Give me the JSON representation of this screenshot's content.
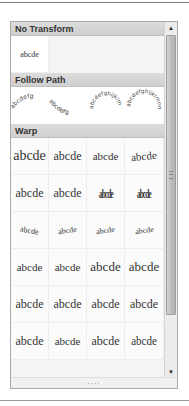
{
  "gallery": {
    "sections": [
      {
        "title": "No Transform"
      },
      {
        "title": "Follow Path"
      },
      {
        "title": "Warp"
      }
    ],
    "no_transform": {
      "sample": "abcde"
    },
    "follow_path": {
      "items": [
        {
          "name": "arch-up",
          "text": "abcdefg"
        },
        {
          "name": "arch-down",
          "text": "abcdefg"
        },
        {
          "name": "circle",
          "text": "abcdefghijklm"
        },
        {
          "name": "button",
          "text": "abcdefghijklmno"
        }
      ]
    },
    "warp": {
      "rows": [
        [
          "abcde",
          "abcde",
          "abcde",
          "abcde"
        ],
        [
          "abcde",
          "abcde",
          "abcde",
          "abcde"
        ],
        [
          "abcde",
          "abcde",
          "abcde",
          "abcde"
        ],
        [
          "abcde",
          "abcde",
          "abcde",
          "abcde"
        ],
        [
          "abcde",
          "abcde",
          "abcde",
          "abcde"
        ],
        [
          "abcde",
          "abcde",
          "abcde",
          "abcde"
        ]
      ]
    },
    "scrollbar": {
      "up_icon": "▲",
      "down_icon": "▼"
    },
    "resize_grip": "····"
  }
}
